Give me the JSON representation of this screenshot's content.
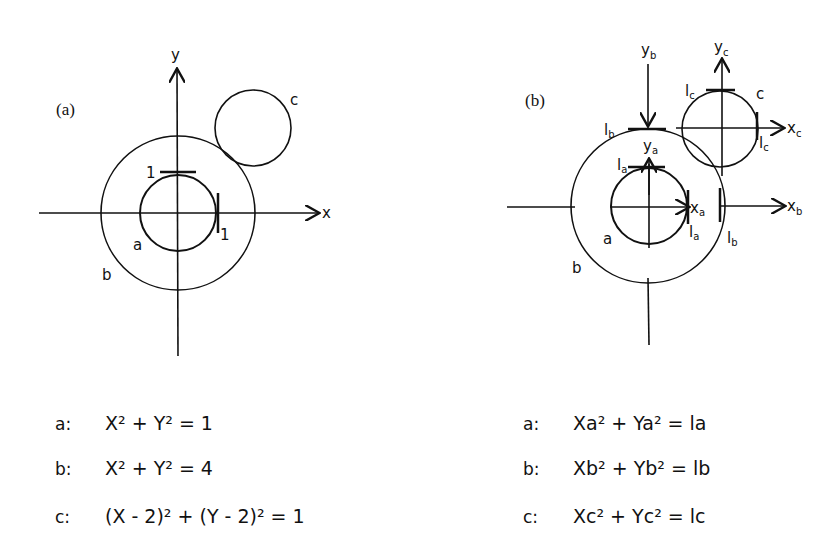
{
  "figure": {
    "panel_a": {
      "label": "(a)",
      "axis_x": "x",
      "axis_y": "y",
      "circles": [
        {
          "name": "a",
          "center": [
            0,
            0
          ],
          "radius": 1
        },
        {
          "name": "b",
          "center": [
            0,
            0
          ],
          "radius": 2
        },
        {
          "name": "c",
          "center": [
            2,
            2
          ],
          "radius": 1
        }
      ],
      "ticks": {
        "x": "1",
        "y": "1"
      },
      "labels": {
        "a": "a",
        "b": "b",
        "c": "c"
      }
    },
    "panel_b": {
      "label": "(b)",
      "axes": {
        "xa": "x",
        "xa_sub": "a",
        "ya": "y",
        "ya_sub": "a",
        "xb": "x",
        "xb_sub": "b",
        "yb": "y",
        "yb_sub": "b",
        "xc": "x",
        "xc_sub": "c",
        "yc": "y",
        "yc_sub": "c"
      },
      "ticks": {
        "la": "l",
        "la_sub": "a",
        "lb": "l",
        "lb_sub": "b",
        "lc": "l",
        "lc_sub": "c"
      },
      "labels": {
        "a": "a",
        "b": "b",
        "c": "c"
      }
    }
  },
  "equations_a": [
    {
      "key": "a:",
      "text": "X² +  Y² = 1"
    },
    {
      "key": "b:",
      "text": "X² +  Y² = 4"
    },
    {
      "key": "c:",
      "text": "(X - 2)² + (Y - 2)² = 1"
    }
  ],
  "equations_b": [
    {
      "key": "a:",
      "text": "Xa² + Ya² = la"
    },
    {
      "key": "b:",
      "text": "Xb² + Yb² = lb"
    },
    {
      "key": "c:",
      "text": "Xc² + Yc² = lc"
    }
  ]
}
